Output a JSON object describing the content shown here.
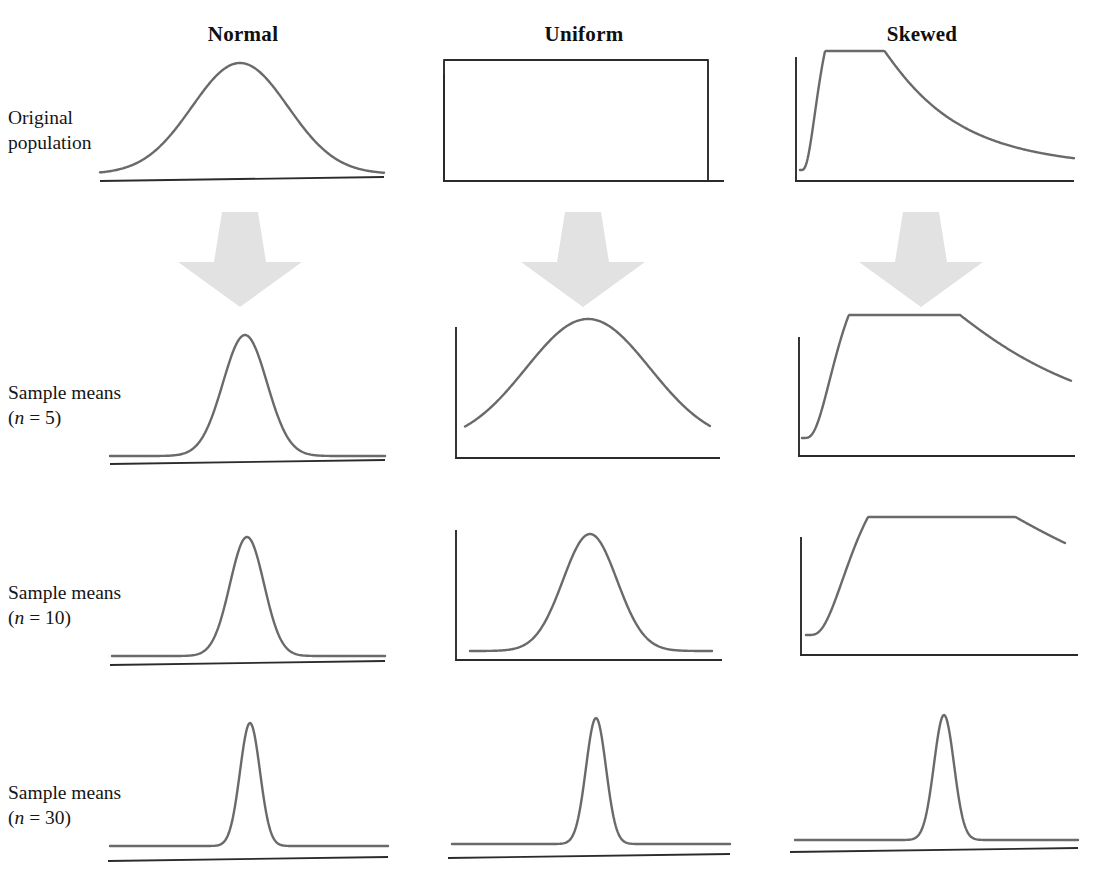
{
  "figure": {
    "title_visible": false,
    "background_color": "#ffffff",
    "curve_color": "#6a6a6a",
    "axis_color": "#2b2b2b",
    "arrow_color": "#e2e2e2",
    "text_color": "#151515"
  },
  "columns": [
    {
      "id": "normal",
      "label": "Normal",
      "heading_x": 243,
      "heading_y": 22
    },
    {
      "id": "uniform",
      "label": "Uniform",
      "heading_x": 584,
      "heading_y": 22
    },
    {
      "id": "skewed",
      "label": "Skewed",
      "heading_x": 922,
      "heading_y": 22
    }
  ],
  "rows": [
    {
      "id": "original-population",
      "label_line1": "Original",
      "label_line2": "population",
      "label_n": "",
      "label_x": 8,
      "label_y": 105
    },
    {
      "id": "sample-means-n5",
      "label_line1": "Sample means",
      "label_line2": "(",
      "label_n": "n",
      "label_eq": " = 5)",
      "label_x": 8,
      "label_y": 380
    },
    {
      "id": "sample-means-n10",
      "label_line1": "Sample means",
      "label_line2": "(",
      "label_n": "n",
      "label_eq": " = 10)",
      "label_x": 8,
      "label_y": 580
    },
    {
      "id": "sample-means-n30",
      "label_line1": "Sample means",
      "label_line2": "(",
      "label_n": "n",
      "label_eq": " = 30)",
      "label_x": 8,
      "label_y": 780
    }
  ],
  "arrows": [
    {
      "id": "arrow-normal",
      "cx": 240,
      "top": 212,
      "bottom": 307,
      "shaft_top_half": 18,
      "shaft_bottom_half": 26,
      "head_half": 62,
      "head_top": 262
    },
    {
      "id": "arrow-uniform",
      "cx": 583,
      "top": 212,
      "bottom": 307,
      "shaft_top_half": 18,
      "shaft_bottom_half": 26,
      "head_half": 62,
      "head_top": 262
    },
    {
      "id": "arrow-skewed",
      "cx": 921,
      "top": 212,
      "bottom": 307,
      "shaft_top_half": 18,
      "shaft_bottom_half": 26,
      "head_half": 62,
      "head_top": 262
    }
  ],
  "chart_data": {
    "type": "line",
    "xlabel": "",
    "ylabel": "",
    "grid": false,
    "legend": "none",
    "columns": [
      "Normal",
      "Uniform",
      "Skewed"
    ],
    "rows": [
      "Original population",
      "Sample means (n = 5)",
      "Sample means (n = 10)",
      "Sample means (n = 30)"
    ],
    "panels": [
      {
        "id": "normal-original",
        "column": "Normal",
        "row": "Original population",
        "shape": "normal",
        "axis": {
          "baseline_y": 181,
          "baseline_x0": 100,
          "baseline_x1": 384,
          "y_axis": false,
          "double_baseline": true
        },
        "curve": {
          "peak_x": 240,
          "peak_y": 70,
          "sigma": 48,
          "x0": 100,
          "x1": 384,
          "tail_y": 174
        }
      },
      {
        "id": "uniform-original",
        "column": "Uniform",
        "row": "Original population",
        "shape": "uniform",
        "axis": {
          "baseline_y": 181,
          "baseline_x0": 443,
          "baseline_x1": 724,
          "y_axis": true,
          "y_axis_top": 74,
          "double_baseline": false
        },
        "curve": {
          "top_y": 60,
          "left_x": 444,
          "right_x": 708
        }
      },
      {
        "id": "skewed-original",
        "column": "Skewed",
        "row": "Original population",
        "shape": "skewed",
        "axis": {
          "baseline_y": 181,
          "baseline_x0": 795,
          "baseline_x1": 1074,
          "y_axis": true,
          "y_axis_top": 57,
          "double_baseline": false
        },
        "curve": {
          "peak_x": 846,
          "peak_y": 62,
          "rise_x": 800,
          "tail_end_x": 1074,
          "tail_y": 170
        }
      },
      {
        "id": "normal-n5",
        "column": "Normal",
        "row": "Sample means (n = 5)",
        "shape": "normal",
        "axis": {
          "baseline_y": 464,
          "baseline_x0": 110,
          "baseline_x1": 385,
          "y_axis": false,
          "double_baseline": true
        },
        "curve": {
          "peak_x": 245,
          "peak_y": 343,
          "sigma": 22,
          "x0": 110,
          "x1": 385,
          "tail_y": 456
        }
      },
      {
        "id": "uniform-n5",
        "column": "Uniform",
        "row": "Sample means (n = 5)",
        "shape": "normal",
        "axis": {
          "baseline_y": 458,
          "baseline_x0": 455,
          "baseline_x1": 720,
          "y_axis": true,
          "y_axis_top": 327,
          "double_baseline": false
        },
        "curve": {
          "peak_x": 588,
          "peak_y": 333,
          "sigma": 62,
          "x0": 465,
          "x1": 710,
          "tail_y": 444
        }
      },
      {
        "id": "skewed-n5",
        "column": "Skewed",
        "row": "Sample means (n = 5)",
        "shape": "skewed",
        "axis": {
          "baseline_y": 456,
          "baseline_x0": 798,
          "baseline_x1": 1075,
          "y_axis": true,
          "y_axis_top": 337,
          "double_baseline": false
        },
        "curve": {
          "peak_x": 888,
          "peak_y": 333,
          "rise_x": 802,
          "tail_end_x": 1071,
          "tail_y": 438
        }
      },
      {
        "id": "normal-n10",
        "column": "Normal",
        "row": "Sample means (n = 10)",
        "shape": "normal",
        "axis": {
          "baseline_y": 665,
          "baseline_x0": 110,
          "baseline_x1": 385,
          "y_axis": false,
          "double_baseline": true
        },
        "curve": {
          "peak_x": 247,
          "peak_y": 546,
          "sigma": 17,
          "x0": 112,
          "x1": 385,
          "tail_y": 656
        }
      },
      {
        "id": "uniform-n10",
        "column": "Uniform",
        "row": "Sample means (n = 10)",
        "shape": "normal",
        "axis": {
          "baseline_y": 660,
          "baseline_x0": 455,
          "baseline_x1": 722,
          "y_axis": true,
          "y_axis_top": 530,
          "double_baseline": false
        },
        "curve": {
          "peak_x": 590,
          "peak_y": 543,
          "sigma": 27,
          "x0": 470,
          "x1": 712,
          "tail_y": 651
        }
      },
      {
        "id": "skewed-n10",
        "column": "Skewed",
        "row": "Sample means (n = 10)",
        "shape": "skewed",
        "axis": {
          "baseline_y": 655,
          "baseline_x0": 800,
          "baseline_x1": 1078,
          "y_axis": true,
          "y_axis_top": 537,
          "double_baseline": false
        },
        "curve": {
          "peak_x": 920,
          "peak_y": 537,
          "rise_x": 806,
          "tail_end_x": 1065,
          "tail_y": 635
        }
      },
      {
        "id": "normal-n30",
        "column": "Normal",
        "row": "Sample means (n = 30)",
        "shape": "normal",
        "axis": {
          "baseline_y": 861,
          "baseline_x0": 108,
          "baseline_x1": 388,
          "y_axis": false,
          "double_baseline": true
        },
        "curve": {
          "peak_x": 250,
          "peak_y": 738,
          "sigma": 10,
          "x0": 110,
          "x1": 388,
          "tail_y": 846
        }
      },
      {
        "id": "uniform-n30",
        "column": "Uniform",
        "row": "Sample means (n = 30)",
        "shape": "normal",
        "axis": {
          "baseline_y": 858,
          "baseline_x0": 448,
          "baseline_x1": 730,
          "y_axis": false,
          "double_baseline": true
        },
        "curve": {
          "peak_x": 596,
          "peak_y": 732,
          "sigma": 10,
          "x0": 452,
          "x1": 730,
          "tail_y": 844
        }
      },
      {
        "id": "skewed-n30",
        "column": "Skewed",
        "row": "Sample means (n = 30)",
        "shape": "normal",
        "axis": {
          "baseline_y": 852,
          "baseline_x0": 790,
          "baseline_x1": 1078,
          "y_axis": false,
          "double_baseline": true
        },
        "curve": {
          "peak_x": 944,
          "peak_y": 727,
          "sigma": 10,
          "x0": 795,
          "x1": 1078,
          "tail_y": 840
        }
      }
    ]
  }
}
